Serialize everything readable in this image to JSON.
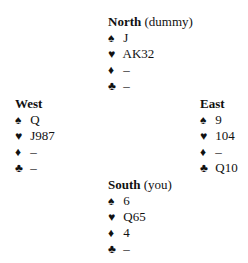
{
  "hands": {
    "north": {
      "name": "North",
      "note": "(dummy)",
      "spades": "J",
      "hearts": "AK32",
      "diamonds": "–",
      "clubs": "–"
    },
    "west": {
      "name": "West",
      "note": "",
      "spades": "Q",
      "hearts": "J987",
      "diamonds": "–",
      "clubs": "–"
    },
    "east": {
      "name": "East",
      "note": "",
      "spades": "9",
      "hearts": "104",
      "diamonds": "–",
      "clubs": "Q10"
    },
    "south": {
      "name": "South",
      "note": "(you)",
      "spades": "6",
      "hearts": "Q65",
      "diamonds": "4",
      "clubs": "–"
    }
  },
  "suit_symbols": {
    "spades": "♠",
    "hearts": "♥",
    "diamonds": "♦",
    "clubs": "♣"
  }
}
